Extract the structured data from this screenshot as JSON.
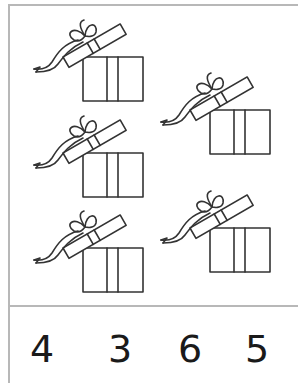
{
  "worksheet": {
    "gifts": [
      {
        "id": "gift-1",
        "x": 28,
        "y": 14
      },
      {
        "id": "gift-2",
        "x": 28,
        "y": 110
      },
      {
        "id": "gift-3",
        "x": 28,
        "y": 205
      },
      {
        "id": "gift-4",
        "x": 155,
        "y": 67
      },
      {
        "id": "gift-5",
        "x": 155,
        "y": 185
      }
    ],
    "gift_count": 5,
    "answer_choices": [
      "4",
      "3",
      "6",
      "5"
    ],
    "colors": {
      "line": "#333333",
      "border": "#b8b8b8",
      "text": "#1a1a1a"
    }
  }
}
